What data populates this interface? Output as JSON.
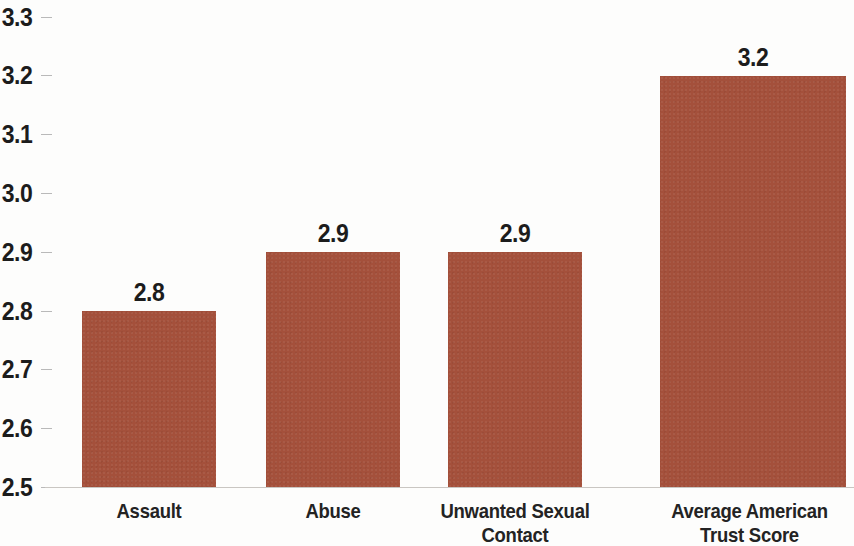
{
  "chart_data": {
    "type": "bar",
    "title": "",
    "subtitle": "",
    "xlabel": "",
    "ylabel": "",
    "categories": [
      "Assault",
      "Abuse",
      "Unwanted Sexual\nContact",
      "Average American\nTrust Score"
    ],
    "category_lines": [
      [
        "Assault"
      ],
      [
        "Abuse"
      ],
      [
        "Unwanted Sexual",
        "Contact"
      ],
      [
        "Average American",
        "Trust Score"
      ]
    ],
    "values": [
      2.8,
      2.9,
      2.9,
      3.2
    ],
    "value_labels": [
      "2.8",
      "2.9",
      "2.9",
      "3.2"
    ],
    "ylim": [
      2.5,
      3.3
    ],
    "ytick_values": [
      3.3,
      3.2,
      3.1,
      3.0,
      2.9,
      2.8,
      2.7,
      2.6,
      2.5
    ],
    "ytick_labels": [
      "3.3",
      "3.2",
      "3.1",
      "3.0",
      "2.9",
      "2.8",
      "2.7",
      "2.6",
      "2.5"
    ],
    "grid": false,
    "legend": null,
    "bar_color": "#a4503b",
    "text_color": "#1c1c1c",
    "axis_color": "#c9c6c2"
  }
}
